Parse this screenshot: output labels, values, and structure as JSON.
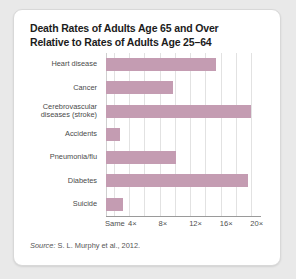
{
  "title": {
    "line1": "Death Rates of Adults Age 65 and Over",
    "line2": "Relative to Rates of Adults Age 25–64"
  },
  "source": {
    "label": "Source:",
    "text": " S. L. Murphy et al., 2012."
  },
  "colors": {
    "bar": "#c49cb2",
    "grid": "#e2e2e2",
    "axis": "#9a9a9a",
    "card": "#ffffff",
    "page": "#e9e9e9",
    "title_text": "#1c1c1c",
    "label_text": "#4a4a4a"
  },
  "chart_data": {
    "type": "bar",
    "orientation": "horizontal",
    "title": "Death Rates of Adults Age 65 and Over Relative to Rates of Adults Age 25–64",
    "xlabel": "",
    "ylabel": "",
    "categories": [
      "Heart disease",
      "Cerebrovascular diseases (stroke)",
      "Cancer",
      "Accidents",
      "Pneumonia/flu",
      "Diabetes",
      "Suicide"
    ],
    "bars": [
      {
        "label_lines": [
          "Heart disease"
        ],
        "value": 15.4
      },
      {
        "label_lines": [
          "Cancer"
        ],
        "value": 9.7
      },
      {
        "label_lines": [
          "Cerebrovascular",
          "diseases (stroke)"
        ],
        "value": 20.0
      },
      {
        "label_lines": [
          "Accidents"
        ],
        "value": 2.8
      },
      {
        "label_lines": [
          "Pneumonia/flu"
        ],
        "value": 10.2
      },
      {
        "label_lines": [
          "Diabetes"
        ],
        "value": 19.6
      },
      {
        "label_lines": [
          "Suicide"
        ],
        "value": 3.2
      }
    ],
    "values": [
      15.4,
      9.7,
      20.0,
      2.8,
      10.2,
      19.6,
      3.2
    ],
    "xlim": [
      1,
      21
    ],
    "xticks": [
      {
        "value": 1,
        "label": "Same"
      },
      {
        "value": 4,
        "label": "4×"
      },
      {
        "value": 8,
        "label": "8×"
      },
      {
        "value": 12,
        "label": "12×"
      },
      {
        "value": 16,
        "label": "16×"
      },
      {
        "value": 20,
        "label": "20×"
      }
    ],
    "gridline_values": [
      1,
      2,
      4,
      6,
      8,
      10,
      12,
      14,
      16,
      18,
      20
    ],
    "grid": true,
    "legend": null
  }
}
